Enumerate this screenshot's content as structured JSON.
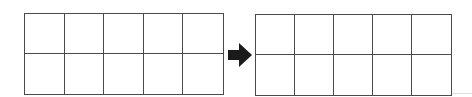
{
  "diagram": {
    "type": "grid-transformation",
    "left_grid": {
      "rows": 2,
      "cols": 5,
      "filled_cells": []
    },
    "right_grid": {
      "rows": 2,
      "cols": 5,
      "filled_cells": []
    },
    "connector": {
      "icon": "right-arrow-icon",
      "direction": "right"
    },
    "colors": {
      "line": "#4a4a4a",
      "arrow": "#1a1a1a",
      "background": "#ffffff"
    }
  }
}
